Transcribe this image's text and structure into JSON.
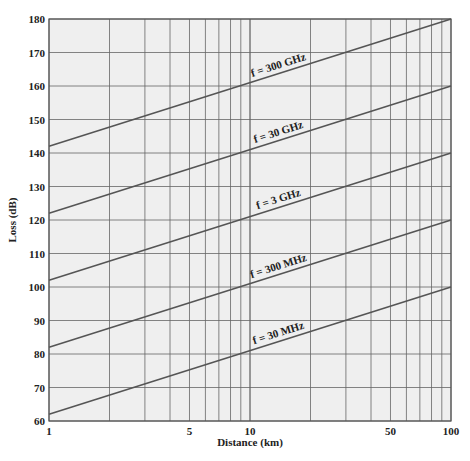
{
  "chart_data": {
    "type": "line",
    "title": "",
    "xlabel": "Distance (km)",
    "ylabel": "Loss (dB)",
    "xscale": "log",
    "xlim": [
      1,
      100
    ],
    "ylim": [
      60,
      180
    ],
    "xticks": [
      1,
      5,
      10,
      50,
      100
    ],
    "yticks": [
      60,
      70,
      80,
      90,
      100,
      110,
      120,
      130,
      140,
      150,
      160,
      170,
      180
    ],
    "grid": true,
    "series": [
      {
        "name": "f = 30 MHz",
        "x": [
          1,
          100
        ],
        "values": [
          62,
          100
        ]
      },
      {
        "name": "f = 300 MHz",
        "x": [
          1,
          100
        ],
        "values": [
          82,
          120
        ]
      },
      {
        "name": "f = 3 GHz",
        "x": [
          1,
          100
        ],
        "values": [
          102,
          140
        ]
      },
      {
        "name": "f = 30 GHz",
        "x": [
          1,
          100
        ],
        "values": [
          122,
          160
        ]
      },
      {
        "name": "f = 300 GHz",
        "x": [
          1,
          100
        ],
        "values": [
          142,
          180
        ]
      }
    ]
  },
  "colors": {
    "background": "#efefef",
    "grid": "#666666",
    "line": "#555555"
  }
}
